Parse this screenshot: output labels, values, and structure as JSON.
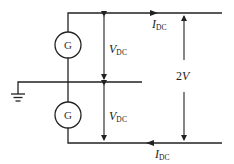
{
  "diagram": {
    "type": "circuit",
    "generators": [
      {
        "id": "top",
        "label": "G"
      },
      {
        "id": "bottom",
        "label": "G"
      }
    ],
    "labels": {
      "current_top": {
        "main": "I",
        "sub": "DC"
      },
      "current_bottom": {
        "main": "I",
        "sub": "DC"
      },
      "voltage_top": {
        "main": "V",
        "sub": "DC"
      },
      "voltage_bottom": {
        "main": "V",
        "sub": "DC"
      },
      "total_voltage": "2V"
    },
    "colors": {
      "line": "#222222",
      "background": "#ffffff"
    }
  }
}
